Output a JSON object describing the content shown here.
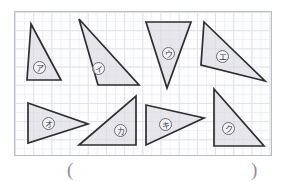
{
  "page": {
    "width": 286,
    "height": 182,
    "background": "#ffffff"
  },
  "grid": {
    "name": "graph-paper-grid",
    "left": 14,
    "top": 11,
    "width": 258,
    "height": 145,
    "major_cell_px": 18.2,
    "minor_cell_px": 9.1,
    "major_line_color": "#dfe3ea",
    "minor_line_color": "#eef0f4",
    "border_color": "#b9bdc6",
    "fill_color": "#fdfdfe"
  },
  "style": {
    "shape_fill": "#dadade",
    "shape_stroke": "#2e2e33",
    "label_text_color": "#3a3a40",
    "label_ring_color": "#6a6a72",
    "paren_color": "#8d9099"
  },
  "shapes": [
    {
      "id": "triangle-a",
      "label": "ア",
      "points": "16,12 46,68 12,68",
      "label_x": 18,
      "label_y": 49
    },
    {
      "id": "triangle-i",
      "label": "イ",
      "points": "64,7 124,73 83,73",
      "label_x": 77,
      "label_y": 50
    },
    {
      "id": "triangle-u",
      "label": "ウ",
      "points": "131,10 176,10 152,76",
      "label_x": 147,
      "label_y": 35
    },
    {
      "id": "triangle-e",
      "label": "エ",
      "points": "189,10 250,69 186,53",
      "label_x": 201,
      "label_y": 38
    },
    {
      "id": "triangle-o",
      "label": "オ",
      "points": "13,91 73,112 13,131",
      "label_x": 27,
      "label_y": 105
    },
    {
      "id": "triangle-ka",
      "label": "カ",
      "points": "121,84 121,133 64,133",
      "label_x": 99,
      "label_y": 112
    },
    {
      "id": "triangle-ki",
      "label": "キ",
      "points": "131,93 189,106 131,133",
      "label_x": 144,
      "label_y": 106
    },
    {
      "id": "triangle-ku",
      "label": "ク",
      "points": "199,77 249,134 199,134",
      "label_x": 207,
      "label_y": 110
    }
  ],
  "answer": {
    "open_paren": "(",
    "close_paren": ")"
  }
}
